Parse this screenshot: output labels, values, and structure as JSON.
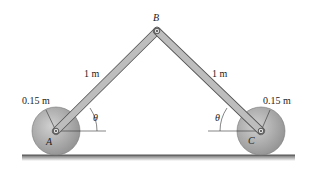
{
  "diagram": {
    "labels": {
      "pin_b": "B",
      "pin_a": "A",
      "pin_c": "C",
      "link_ab_length": "1 m",
      "link_bc_length": "1 m",
      "wheel_a_radius": "0.15 m",
      "wheel_c_radius": "0.15 m",
      "angle_a": "θ",
      "angle_c": "θ"
    },
    "colors": {
      "link_fill": "#b9b9b9",
      "link_stroke": "#555555",
      "wheel_fill": "#a9a9a9",
      "ground": "#6e6e6e",
      "dimension_line": "#333333"
    }
  }
}
